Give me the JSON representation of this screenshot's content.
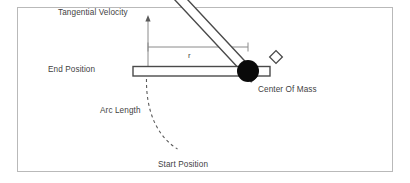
{
  "diagram": {
    "frame": {
      "x": 17,
      "y": 7,
      "width": 376,
      "height": 165,
      "stroke": "#b9b9b9"
    },
    "labels": {
      "tangential_velocity": "Tangential Velocity",
      "end_position": "End Position",
      "center_of_mass": "Center Of Mass",
      "arc_length": "Arc Length",
      "start_position": "Start Position",
      "radius": "r"
    },
    "colors": {
      "background": "#ffffff",
      "frame_border": "#b9b9b9",
      "text": "#3f3f3f",
      "bar_outline": "#4a4a4a",
      "bar_fill": "#ffffff",
      "pivot_fill": "#0a0a0a",
      "dimension_line": "#808080",
      "arrow_line": "#8a8a8a",
      "arc_dash": "#5a5a5a"
    },
    "geometry": {
      "pivot": {
        "cx": 248,
        "cy": 71,
        "r": 11
      },
      "horizontal_bar": {
        "x": 133,
        "y": 66.5,
        "width": 137,
        "height": 9.5
      },
      "diagonal_bar": {
        "from_x": 248,
        "from_y": 71,
        "to_x": 170,
        "to_y": 155,
        "thickness": 9.5,
        "angle_deg": 47
      },
      "velocity_arrow": {
        "x": 148,
        "y_top": 16,
        "y_bottom": 76
      },
      "dimension_line": {
        "x_start": 148,
        "x_end": 248,
        "y": 47
      },
      "arc": {
        "start_x": 148,
        "start_y": 78,
        "end_x": 178,
        "end_y": 148,
        "dash": "3 3"
      },
      "end_cap_square": {
        "cx": 276,
        "cy": 57,
        "size": 9,
        "rotation_deg": 45
      },
      "bar_right_tip": {
        "x": 258,
        "y": 66.5,
        "width": 12,
        "height": 9.5
      }
    }
  }
}
